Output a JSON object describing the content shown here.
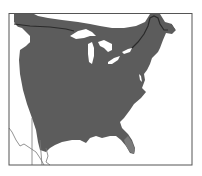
{
  "map": {
    "type": "species-range-map",
    "region": "Eastern North America",
    "colors": {
      "background": "#ffffff",
      "range_fill": "#5c5c5c",
      "water": "#ffffff",
      "border_line": "#2a2a2a",
      "frame": "#555555",
      "boundary_thin": "#888888",
      "peninsula_shade": "#7a7a7a"
    },
    "features": [
      "range-area",
      "great-lakes",
      "us-canada-border",
      "state-boundaries",
      "frame"
    ]
  }
}
